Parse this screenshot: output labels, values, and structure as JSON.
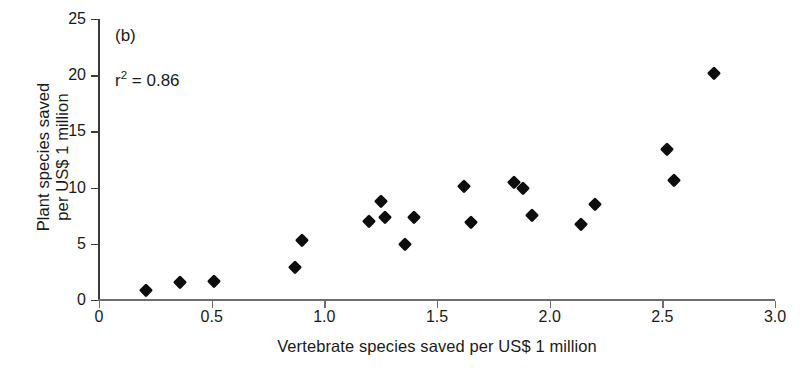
{
  "chart_data": {
    "type": "scatter",
    "title": "",
    "panel_label": "(b)",
    "annotation": "r² = 0.86",
    "annotation_base": "r",
    "annotation_exponent": "2",
    "annotation_rest": " = 0.86",
    "xlabel": "Vertebrate species saved per US$ 1 million",
    "ylabel_line1": "Plant species saved",
    "ylabel_line2": "per US$ 1 million",
    "xlim": [
      0,
      3.0
    ],
    "ylim": [
      0,
      25
    ],
    "xticks": [
      0,
      0.5,
      1.0,
      1.5,
      2.0,
      2.5,
      3.0
    ],
    "xtick_labels": [
      "0",
      "0.5",
      "1.0",
      "1.5",
      "2.0",
      "2.5",
      "3.0"
    ],
    "yticks": [
      0,
      5,
      10,
      15,
      20,
      25
    ],
    "ytick_labels": [
      "0",
      "5",
      "10",
      "15",
      "20",
      "25"
    ],
    "grid": false,
    "legend": null,
    "marker": "diamond",
    "marker_color": "#0d0d0d",
    "background_color": "#ffffff",
    "axis_color": "#3a3a3a",
    "n_points": 20,
    "points": [
      {
        "x": 0.21,
        "y": 0.9
      },
      {
        "x": 0.36,
        "y": 1.6
      },
      {
        "x": 0.51,
        "y": 1.7
      },
      {
        "x": 0.87,
        "y": 2.9
      },
      {
        "x": 0.9,
        "y": 5.3
      },
      {
        "x": 1.2,
        "y": 7.0
      },
      {
        "x": 1.25,
        "y": 8.8
      },
      {
        "x": 1.27,
        "y": 7.4
      },
      {
        "x": 1.36,
        "y": 5.0
      },
      {
        "x": 1.4,
        "y": 7.4
      },
      {
        "x": 1.62,
        "y": 10.1
      },
      {
        "x": 1.65,
        "y": 6.9
      },
      {
        "x": 1.84,
        "y": 10.5
      },
      {
        "x": 1.88,
        "y": 10.0
      },
      {
        "x": 1.92,
        "y": 7.6
      },
      {
        "x": 2.14,
        "y": 6.8
      },
      {
        "x": 2.2,
        "y": 8.5
      },
      {
        "x": 2.52,
        "y": 13.4
      },
      {
        "x": 2.55,
        "y": 10.7
      },
      {
        "x": 2.73,
        "y": 20.2
      }
    ]
  }
}
